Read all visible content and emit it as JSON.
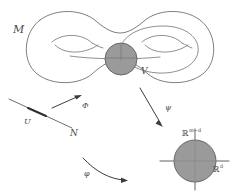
{
  "figure": {
    "caption_none": "",
    "background_color": "#ffffff",
    "ink_color": "#4a4a4a",
    "shade_color": "#9a9a9a",
    "outline_color": "#6f6f6f"
  },
  "labels": {
    "manifold": "M",
    "neighborhood": "V",
    "submanifold": "N",
    "open_set": "U",
    "map_phi_upper": "Φ",
    "map_psi": "ψ",
    "map_phi_lower": "φ"
  },
  "axes": {
    "vertical_base": "ℝ",
    "vertical_exponent": "m−d",
    "horizontal_base": "ℝ",
    "horizontal_exponent": "d"
  }
}
